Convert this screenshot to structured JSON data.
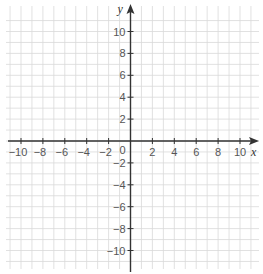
{
  "chart_data": {
    "type": "scatter",
    "title": "",
    "xlabel": "x",
    "ylabel": "y",
    "xlim": [
      -11,
      11
    ],
    "ylim": [
      -11,
      11
    ],
    "grid": true,
    "grid_step": 1,
    "x_ticks": [
      -10,
      -8,
      -6,
      -4,
      -2,
      2,
      4,
      6,
      8,
      10
    ],
    "y_ticks": [
      -10,
      -8,
      -6,
      -4,
      -2,
      2,
      4,
      6,
      8,
      10
    ],
    "x_tick_labels": [
      "−10",
      "−8",
      "−6",
      "−4",
      "−2",
      "2",
      "4",
      "6",
      "8",
      "10"
    ],
    "y_tick_labels": [
      "−10",
      "−8",
      "−6",
      "−4",
      "−2",
      "2",
      "4",
      "6",
      "8",
      "10"
    ],
    "origin_label": "0",
    "series": [],
    "colors": {
      "grid": "#d9d9d9",
      "axis": "#333333",
      "label": "#555555"
    }
  }
}
